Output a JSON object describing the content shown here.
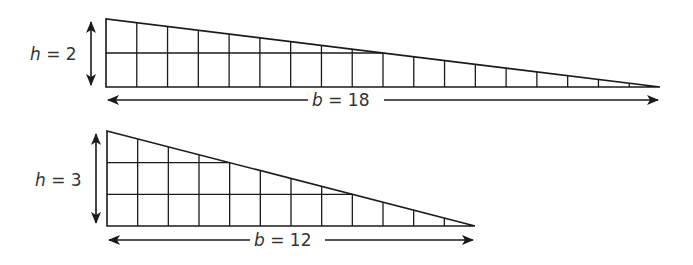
{
  "diagram": {
    "triangles": [
      {
        "id": "top",
        "height_label": "h = 2",
        "height_var": "h",
        "height_value": "2",
        "base_label": "b = 18",
        "base_var": "b",
        "base_value": "18",
        "height": 2,
        "base": 18
      },
      {
        "id": "bottom",
        "height_label": "h = 3",
        "height_var": "h",
        "height_value": "3",
        "base_label": "b = 12",
        "base_var": "b",
        "base_value": "12",
        "height": 3,
        "base": 12
      }
    ],
    "colors": {
      "line": "#1a1a1a",
      "text": "#333333",
      "background": "#ffffff"
    }
  }
}
